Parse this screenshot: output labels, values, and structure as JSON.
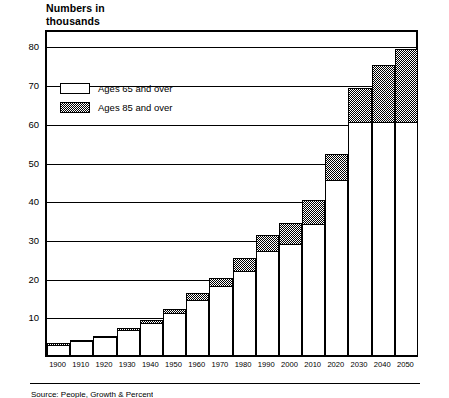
{
  "chart_data": {
    "type": "bar",
    "subtype": "stacked",
    "xlabel": "",
    "ylabel": "",
    "ylim": [
      0,
      84
    ],
    "yticks": [
      10,
      20,
      30,
      40,
      50,
      60,
      70,
      80
    ],
    "grid": true,
    "legend_position": "upper-left-inside",
    "categories": [
      "1900",
      "1910",
      "1920",
      "1930",
      "1940",
      "1950",
      "1960",
      "1970",
      "1980",
      "1990",
      "2000",
      "2010",
      "2020",
      "2030",
      "2040",
      "2050"
    ],
    "series": [
      {
        "name": "Ages 65 and over",
        "values": [
          3,
          4,
          5,
          7,
          9,
          12,
          16,
          20,
          25,
          31,
          34,
          40,
          52,
          69,
          75,
          79
        ]
      },
      {
        "name": "Ages 85 and over",
        "values": [
          0.3,
          0.4,
          0.5,
          0.7,
          1.0,
          1.5,
          2.0,
          2.5,
          3.5,
          4.5,
          5.5,
          6.5,
          7.0,
          9.0,
          15.0,
          19.0
        ]
      }
    ],
    "stack_base_for_85": [
      2.7,
      3.6,
      4.5,
      6.3,
      8.0,
      10.5,
      14.0,
      17.5,
      21.5,
      26.5,
      28.5,
      33.5,
      45.0,
      60.0,
      60.0,
      60.0
    ]
  },
  "title": {
    "line1": "Numbers in",
    "line2": "thousands"
  },
  "legend": {
    "items": [
      {
        "label": "Ages 65 and over",
        "pattern": "solid-white"
      },
      {
        "label": "Ages 85 and over",
        "pattern": "dotted-gray"
      }
    ]
  },
  "footer": {
    "text": "Source: People, Growth & Percent"
  }
}
